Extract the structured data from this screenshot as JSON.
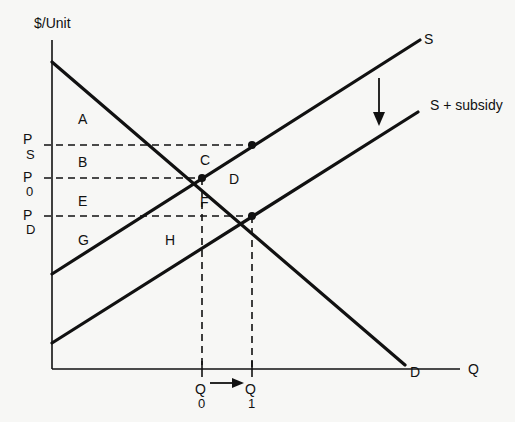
{
  "diagram": {
    "axes": {
      "y_label": "$/Unit",
      "x_label": "Q"
    },
    "curves": {
      "demand": {
        "label": "D",
        "from": [
          52,
          62
        ],
        "to": [
          405,
          365
        ]
      },
      "supply": {
        "label": "S",
        "from": [
          52,
          274
        ],
        "to": [
          420,
          40
        ]
      },
      "supply_subsidy": {
        "label": "S + subsidy",
        "from": [
          52,
          343
        ],
        "to": [
          418,
          112
        ]
      }
    },
    "shift_arrow": {
      "direction": "down",
      "meaning": "supply shifts down by subsidy"
    },
    "prices": {
      "ps": {
        "main": "P",
        "sub": "S",
        "y": 145
      },
      "p0": {
        "main": "P",
        "sub": "0",
        "y": 178
      },
      "pd": {
        "main": "P",
        "sub": "D",
        "y": 216
      }
    },
    "quantities": {
      "q0": {
        "main": "Q",
        "sub": "0",
        "x": 202
      },
      "q1": {
        "main": "Q",
        "sub": "1",
        "x": 252
      }
    },
    "quantity_arrow": {
      "from": "Q0",
      "to": "Q1"
    },
    "points": [
      {
        "name": "original-equilibrium",
        "x": 202,
        "y": 178
      },
      {
        "name": "new-equilibrium-buyers",
        "x": 252,
        "y": 216
      },
      {
        "name": "sellers-price-point",
        "x": 252,
        "y": 145
      }
    ],
    "regions": {
      "a": "A",
      "b": "B",
      "c": "C",
      "d": "D",
      "e": "E",
      "f": "F",
      "g": "G",
      "h": "H"
    },
    "colors": {
      "ink": "#111111",
      "background": "#f7f7f5"
    }
  }
}
